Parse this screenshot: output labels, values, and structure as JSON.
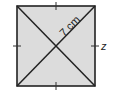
{
  "diagram": {
    "shape": "square",
    "fill_color": "#dcdcdc",
    "stroke_color": "#222222",
    "square": {
      "x": 17,
      "y": 6,
      "size": 79
    },
    "diagonals": 2,
    "tick_marks": [
      "top",
      "right",
      "bottom",
      "left"
    ],
    "labels": {
      "half_diagonal": "7 cm",
      "side_variable": "z"
    }
  }
}
